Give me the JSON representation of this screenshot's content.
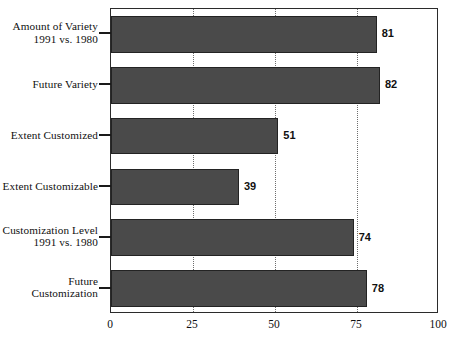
{
  "chart_data": {
    "type": "bar",
    "orientation": "horizontal",
    "title": "",
    "subtitle": "",
    "xlabel": "",
    "ylabel": "",
    "xlim": [
      0,
      100
    ],
    "xticks": [
      0,
      25,
      50,
      75,
      100
    ],
    "xtick_labels": [
      "0",
      "25",
      "50",
      "75",
      "100"
    ],
    "grid": true,
    "grid_axis": "x",
    "grid_style": "dotted",
    "legend": false,
    "legend_position": "none",
    "categories": [
      "Amount of Variety\n1991 vs. 1980",
      "Future Variety",
      "Extent Customized",
      "Extent Customizable",
      "Customization Level\n1991 vs. 1980",
      "Future Customization"
    ],
    "values": [
      81,
      82,
      51,
      39,
      74,
      78
    ],
    "data_labels": [
      "81",
      "82",
      "51",
      "39",
      "74",
      "78"
    ],
    "bar_color": "#4a4a4a",
    "bar_edge_color": "#232323",
    "background_color": "#ffffff",
    "frame_color": "#2b2b2b"
  }
}
